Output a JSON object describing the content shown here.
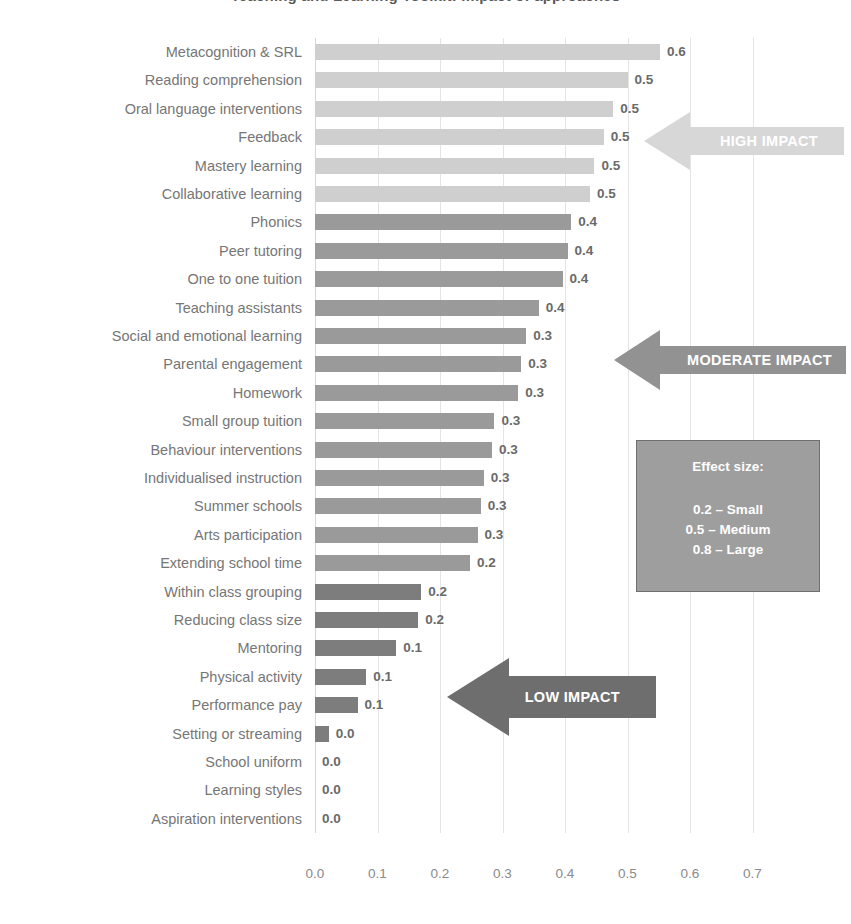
{
  "chart_data": {
    "type": "bar",
    "orientation": "horizontal",
    "title": "Teaching and Learning Toolkit: impact of approaches",
    "xlabel": "",
    "ylabel": "",
    "xlim": [
      0.0,
      0.755
    ],
    "grid": true,
    "xticks": [
      "0.0",
      "0.1",
      "0.2",
      "0.3",
      "0.4",
      "0.5",
      "0.6",
      "0.7"
    ],
    "xtick_values": [
      0.0,
      0.1,
      0.2,
      0.3,
      0.4,
      0.5,
      0.6,
      0.7
    ],
    "categories": [
      "Metacognition & SRL",
      "Reading comprehension",
      "Oral language interventions",
      "Feedback",
      "Mastery learning",
      "Collaborative learning",
      "Phonics",
      "Peer tutoring",
      "One to one tuition",
      "Teaching assistants",
      "Social and emotional learning",
      "Parental engagement",
      "Homework",
      "Small group tuition",
      "Behaviour interventions",
      "Individualised instruction",
      "Summer schools",
      "Arts participation",
      "Extending school time",
      "Within class grouping",
      "Reducing class size",
      "Mentoring",
      "Physical activity",
      "Performance pay",
      "Setting or streaming",
      "School uniform",
      "Learning styles",
      "Aspiration interventions"
    ],
    "values": [
      0.552,
      0.5,
      0.477,
      0.462,
      0.447,
      0.44,
      0.41,
      0.404,
      0.396,
      0.358,
      0.338,
      0.33,
      0.325,
      0.287,
      0.283,
      0.27,
      0.265,
      0.26,
      0.248,
      0.17,
      0.165,
      0.13,
      0.082,
      0.068,
      0.022,
      0.0,
      0.0,
      0.0
    ],
    "value_labels": [
      "0.6",
      "0.5",
      "0.5",
      "0.5",
      "0.5",
      "0.5",
      "0.4",
      "0.4",
      "0.4",
      "0.4",
      "0.3",
      "0.3",
      "0.3",
      "0.3",
      "0.3",
      "0.3",
      "0.3",
      "0.3",
      "0.2",
      "0.2",
      "0.2",
      "0.1",
      "0.1",
      "0.1",
      "0.0",
      "0.0",
      "0.0",
      "0.0"
    ],
    "bands": [
      "high",
      "high",
      "high",
      "high",
      "high",
      "high",
      "mod",
      "mod",
      "mod",
      "mod",
      "mod",
      "mod",
      "mod",
      "mod",
      "mod",
      "mod",
      "mod",
      "mod",
      "mod",
      "low",
      "low",
      "low",
      "low",
      "low",
      "low",
      "low",
      "low",
      "low"
    ],
    "colors": {
      "high": "#cfcfcf",
      "moderate": "#9a9a9a",
      "low": "#7d7d7d",
      "legend_box": "#9e9e9e",
      "text": "#767676",
      "grid": "#e4e4e4"
    }
  },
  "annotations": {
    "high_impact": {
      "label": "HIGH IMPACT"
    },
    "moderate_impact": {
      "label": "MODERATE IMPACT"
    },
    "low_impact": {
      "label": "LOW IMPACT"
    }
  },
  "legend": {
    "title": "Effect size:",
    "lines": [
      "0.2 – Small",
      "0.5 – Medium",
      "0.8 – Large"
    ]
  }
}
